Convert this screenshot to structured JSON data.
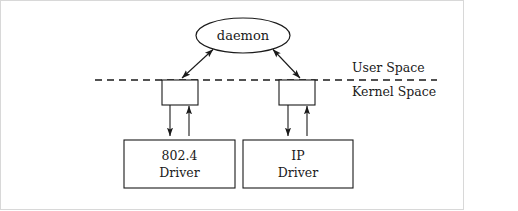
{
  "figure": {
    "caption_none": "",
    "ellipse": {
      "label": "daemon"
    },
    "boundary": {
      "upper_label": "User Space",
      "lower_label": "Kernel Space"
    },
    "drivers": [
      {
        "line1": "802.4",
        "line2": "Driver"
      },
      {
        "line1": "IP",
        "line2": "Driver"
      }
    ],
    "interfaces": [
      {
        "name": "left-interface-box"
      },
      {
        "name": "right-interface-box"
      }
    ],
    "colors": {
      "stroke": "#1a1a1a",
      "fill": "#ffffff",
      "frame": "#d8d8d8"
    }
  }
}
